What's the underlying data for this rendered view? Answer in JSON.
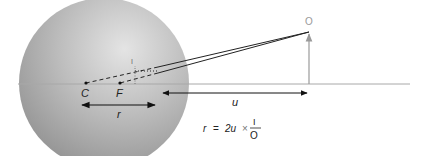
{
  "diagram": {
    "labels": {
      "center": "C",
      "focus": "F",
      "image": "I",
      "object": "O",
      "radius": "r",
      "distance": "u"
    },
    "formula": {
      "lhs": "r",
      "equals": "=",
      "term": "2u",
      "times": "×",
      "numerator": "I",
      "denominator": "O"
    },
    "colors": {
      "sphere_light": "#d9d9d9",
      "sphere_dark": "#8a8a8a",
      "axis": "#a8a8a8",
      "object_arrow": "#9a9a9a",
      "ray": "#222222"
    }
  }
}
